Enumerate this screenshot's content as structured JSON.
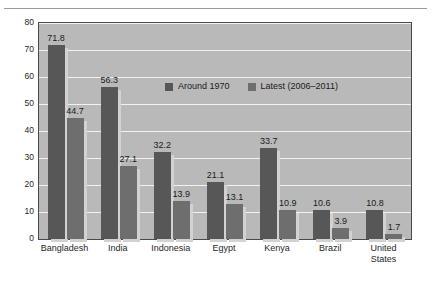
{
  "chart_data": {
    "type": "bar",
    "title": "",
    "subtitle": "",
    "xlabel": "",
    "ylabel": "",
    "ylim": [
      0,
      80
    ],
    "yticks": [
      0,
      10,
      20,
      30,
      40,
      50,
      60,
      70,
      80
    ],
    "grid": true,
    "legend_position": "top-center",
    "categories": [
      "Bangladesh",
      "India",
      "Indonesia",
      "Egypt",
      "Kenya",
      "Brazil",
      "United\nStates"
    ],
    "series": [
      {
        "name": "Around 1970",
        "color": "#575757",
        "values": [
          71.8,
          56.3,
          32.2,
          21.1,
          33.7,
          10.6,
          10.8
        ]
      },
      {
        "name": "Latest (2006–2011)",
        "color": "#6e6e6e",
        "values": [
          44.7,
          27.1,
          13.9,
          13.1,
          10.9,
          3.9,
          1.7
        ]
      }
    ]
  },
  "style": {
    "plot_background": "#b9b9b9",
    "gridline_color": "#f2f2f2",
    "axis_color": "#4a4a4a",
    "rule_color": "#9b9b9b",
    "page_background": "#ffffff",
    "shadow_color": "#d2d2d2"
  }
}
